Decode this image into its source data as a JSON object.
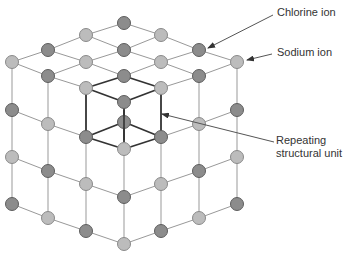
{
  "labels": {
    "chlorine": "Chlorine ion",
    "sodium": "Sodium ion",
    "repeat_line1": "Repeating",
    "repeat_line2": "structural unit"
  },
  "colors": {
    "chlorine_fill": "#8c8c8c",
    "chlorine_stroke": "#5e5e5e",
    "sodium_fill": "#bcbcbc",
    "sodium_stroke": "#8a8a8a",
    "bond": "#999999",
    "unit_bond": "#333333",
    "arrow": "#555555"
  },
  "ions": [
    {
      "x": 124,
      "y": 23,
      "type": "chlorine"
    },
    {
      "x": 86,
      "y": 35,
      "type": "sodium"
    },
    {
      "x": 161,
      "y": 35,
      "type": "sodium"
    },
    {
      "x": 48,
      "y": 50,
      "type": "chlorine"
    },
    {
      "x": 124,
      "y": 50,
      "type": "chlorine"
    },
    {
      "x": 199,
      "y": 50,
      "type": "chlorine"
    },
    {
      "x": 12,
      "y": 62,
      "type": "sodium"
    },
    {
      "x": 86,
      "y": 62,
      "type": "sodium"
    },
    {
      "x": 161,
      "y": 62,
      "type": "sodium"
    },
    {
      "x": 237,
      "y": 62,
      "type": "sodium"
    },
    {
      "x": 48,
      "y": 76,
      "type": "chlorine"
    },
    {
      "x": 124,
      "y": 76,
      "type": "chlorine"
    },
    {
      "x": 199,
      "y": 76,
      "type": "chlorine"
    },
    {
      "x": 86,
      "y": 88,
      "type": "sodium"
    },
    {
      "x": 161,
      "y": 88,
      "type": "sodium"
    },
    {
      "x": 124,
      "y": 102,
      "type": "chlorine"
    },
    {
      "x": 12,
      "y": 110,
      "type": "chlorine"
    },
    {
      "x": 237,
      "y": 110,
      "type": "chlorine"
    },
    {
      "x": 48,
      "y": 124,
      "type": "sodium"
    },
    {
      "x": 124,
      "y": 122,
      "type": "chlorine"
    },
    {
      "x": 199,
      "y": 124,
      "type": "sodium"
    },
    {
      "x": 86,
      "y": 137,
      "type": "chlorine"
    },
    {
      "x": 161,
      "y": 137,
      "type": "chlorine"
    },
    {
      "x": 124,
      "y": 149,
      "type": "sodium"
    },
    {
      "x": 12,
      "y": 157,
      "type": "sodium"
    },
    {
      "x": 237,
      "y": 157,
      "type": "sodium"
    },
    {
      "x": 48,
      "y": 171,
      "type": "chlorine"
    },
    {
      "x": 199,
      "y": 171,
      "type": "chlorine"
    },
    {
      "x": 86,
      "y": 184,
      "type": "sodium"
    },
    {
      "x": 161,
      "y": 184,
      "type": "sodium"
    },
    {
      "x": 124,
      "y": 197,
      "type": "chlorine"
    },
    {
      "x": 12,
      "y": 204,
      "type": "chlorine"
    },
    {
      "x": 237,
      "y": 204,
      "type": "chlorine"
    },
    {
      "x": 48,
      "y": 218,
      "type": "sodium"
    },
    {
      "x": 199,
      "y": 218,
      "type": "sodium"
    },
    {
      "x": 86,
      "y": 231,
      "type": "chlorine"
    },
    {
      "x": 161,
      "y": 231,
      "type": "chlorine"
    },
    {
      "x": 124,
      "y": 244,
      "type": "sodium"
    }
  ],
  "bonds": [
    [
      124,
      23,
      86,
      35
    ],
    [
      124,
      23,
      161,
      35
    ],
    [
      86,
      35,
      48,
      50
    ],
    [
      86,
      35,
      124,
      50
    ],
    [
      161,
      35,
      124,
      50
    ],
    [
      161,
      35,
      199,
      50
    ],
    [
      48,
      50,
      12,
      62
    ],
    [
      48,
      50,
      86,
      62
    ],
    [
      124,
      50,
      86,
      62
    ],
    [
      124,
      50,
      161,
      62
    ],
    [
      199,
      50,
      161,
      62
    ],
    [
      199,
      50,
      237,
      62
    ],
    [
      12,
      62,
      48,
      76
    ],
    [
      86,
      62,
      48,
      76
    ],
    [
      86,
      62,
      124,
      76
    ],
    [
      161,
      62,
      124,
      76
    ],
    [
      161,
      62,
      199,
      76
    ],
    [
      237,
      62,
      199,
      76
    ],
    [
      48,
      76,
      86,
      88
    ],
    [
      199,
      76,
      161,
      88
    ],
    [
      12,
      62,
      12,
      110
    ],
    [
      12,
      110,
      12,
      157
    ],
    [
      12,
      157,
      12,
      204
    ],
    [
      237,
      62,
      237,
      110
    ],
    [
      237,
      110,
      237,
      157
    ],
    [
      237,
      157,
      237,
      204
    ],
    [
      48,
      76,
      48,
      124
    ],
    [
      48,
      124,
      48,
      171
    ],
    [
      48,
      171,
      48,
      218
    ],
    [
      199,
      76,
      199,
      124
    ],
    [
      199,
      124,
      199,
      171
    ],
    [
      199,
      171,
      199,
      218
    ],
    [
      86,
      137,
      86,
      184
    ],
    [
      86,
      184,
      86,
      231
    ],
    [
      161,
      137,
      161,
      184
    ],
    [
      161,
      184,
      161,
      231
    ],
    [
      124,
      149,
      124,
      197
    ],
    [
      124,
      197,
      124,
      244
    ],
    [
      12,
      110,
      48,
      124
    ],
    [
      48,
      124,
      86,
      137
    ],
    [
      237,
      110,
      199,
      124
    ],
    [
      199,
      124,
      161,
      137
    ],
    [
      12,
      157,
      48,
      171
    ],
    [
      48,
      171,
      86,
      184
    ],
    [
      86,
      184,
      124,
      197
    ],
    [
      237,
      157,
      199,
      171
    ],
    [
      199,
      171,
      161,
      184
    ],
    [
      161,
      184,
      124,
      197
    ],
    [
      12,
      204,
      48,
      218
    ],
    [
      48,
      218,
      86,
      231
    ],
    [
      86,
      231,
      124,
      244
    ],
    [
      237,
      204,
      199,
      218
    ],
    [
      199,
      218,
      161,
      231
    ],
    [
      161,
      231,
      124,
      244
    ]
  ],
  "unit_bonds": [
    [
      124,
      76,
      86,
      88
    ],
    [
      124,
      76,
      161,
      88
    ],
    [
      86,
      88,
      124,
      102
    ],
    [
      161,
      88,
      124,
      102
    ],
    [
      86,
      88,
      86,
      137
    ],
    [
      161,
      88,
      161,
      137
    ],
    [
      124,
      108,
      124,
      142
    ],
    [
      86,
      137,
      124,
      149
    ],
    [
      161,
      137,
      124,
      149
    ],
    [
      86,
      137,
      124,
      122
    ],
    [
      161,
      137,
      124,
      122
    ]
  ],
  "arrows": [
    {
      "name": "chlorine-arrow",
      "x1": 273,
      "y1": 15,
      "x2": 208,
      "y2": 48
    },
    {
      "name": "sodium-arrow",
      "x1": 272,
      "y1": 54,
      "x2": 247,
      "y2": 60
    },
    {
      "name": "repeating-unit-arrow",
      "x1": 274,
      "y1": 142,
      "x2": 162,
      "y2": 114
    }
  ]
}
